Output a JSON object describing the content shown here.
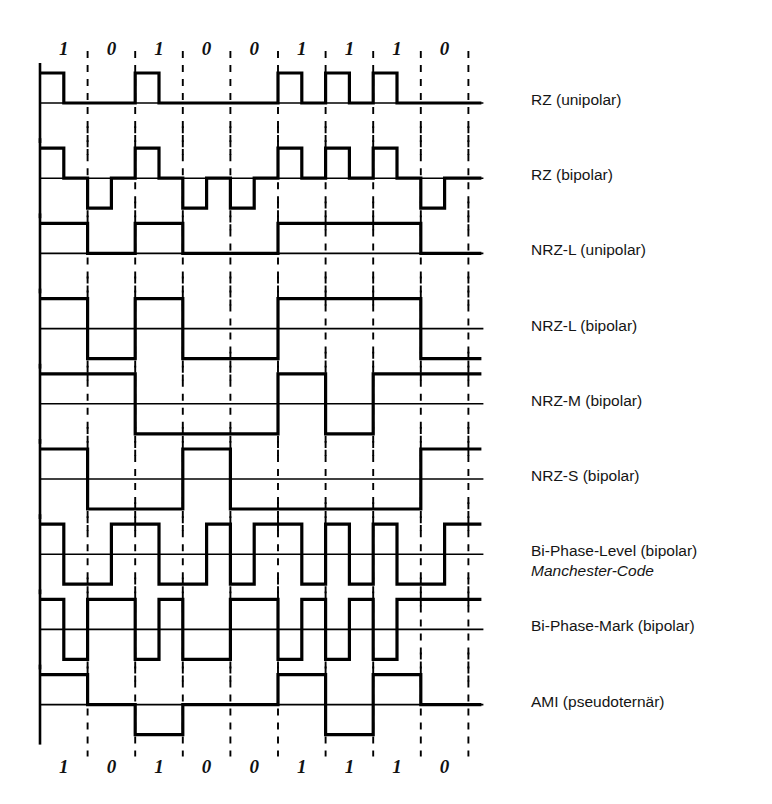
{
  "figure": {
    "bits": [
      "1",
      "0",
      "1",
      "0",
      "0",
      "1",
      "1",
      "1",
      "0"
    ],
    "bit_values": [
      1,
      0,
      1,
      0,
      0,
      1,
      1,
      1,
      0
    ],
    "bit_count": 9,
    "ink_color": "#000000",
    "background_color": "#ffffff"
  },
  "geometry": {
    "origin_x": 40,
    "bit_width": 47.6,
    "first_row_baseline_y": 103,
    "row_spacing": 75.2,
    "amplitude": 30,
    "label_x": 531
  },
  "rows": [
    {
      "id": "rz-unipolar",
      "label": "RZ (unipolar)",
      "sublabel": "",
      "code": "RZ",
      "polarity": "unipolar",
      "levels_per_bit": [
        [
          1,
          0
        ],
        [
          0,
          0
        ],
        [
          1,
          0
        ],
        [
          0,
          0
        ],
        [
          0,
          0
        ],
        [
          1,
          0
        ],
        [
          1,
          0
        ],
        [
          1,
          0
        ],
        [
          0,
          0
        ]
      ]
    },
    {
      "id": "rz-bipolar",
      "label": "RZ (bipolar)",
      "sublabel": "",
      "code": "RZ",
      "polarity": "bipolar",
      "levels_per_bit": [
        [
          1,
          0
        ],
        [
          -1,
          0
        ],
        [
          1,
          0
        ],
        [
          -1,
          0
        ],
        [
          -1,
          0
        ],
        [
          1,
          0
        ],
        [
          1,
          0
        ],
        [
          1,
          0
        ],
        [
          -1,
          0
        ]
      ]
    },
    {
      "id": "nrz-l-unipolar",
      "label": "NRZ-L (unipolar)",
      "sublabel": "",
      "code": "NRZ-L",
      "polarity": "unipolar",
      "levels_per_bit": [
        [
          1,
          1
        ],
        [
          0,
          0
        ],
        [
          1,
          1
        ],
        [
          0,
          0
        ],
        [
          0,
          0
        ],
        [
          1,
          1
        ],
        [
          1,
          1
        ],
        [
          1,
          1
        ],
        [
          0,
          0
        ]
      ]
    },
    {
      "id": "nrz-l-bipolar",
      "label": "NRZ-L (bipolar)",
      "sublabel": "",
      "code": "NRZ-L",
      "polarity": "bipolar",
      "levels_per_bit": [
        [
          1,
          1
        ],
        [
          -1,
          -1
        ],
        [
          1,
          1
        ],
        [
          -1,
          -1
        ],
        [
          -1,
          -1
        ],
        [
          1,
          1
        ],
        [
          1,
          1
        ],
        [
          1,
          1
        ],
        [
          -1,
          -1
        ]
      ]
    },
    {
      "id": "nrz-m-bipolar",
      "label": "NRZ-M (bipolar)",
      "sublabel": "",
      "code": "NRZ-M",
      "polarity": "bipolar",
      "levels_per_bit": [
        [
          1,
          1
        ],
        [
          1,
          1
        ],
        [
          -1,
          -1
        ],
        [
          -1,
          -1
        ],
        [
          -1,
          -1
        ],
        [
          1,
          1
        ],
        [
          -1,
          -1
        ],
        [
          1,
          1
        ],
        [
          1,
          1
        ]
      ]
    },
    {
      "id": "nrz-s-bipolar",
      "label": "NRZ-S (bipolar)",
      "sublabel": "",
      "code": "NRZ-S",
      "polarity": "bipolar",
      "levels_per_bit": [
        [
          1,
          1
        ],
        [
          -1,
          -1
        ],
        [
          -1,
          -1
        ],
        [
          1,
          1
        ],
        [
          -1,
          -1
        ],
        [
          -1,
          -1
        ],
        [
          -1,
          -1
        ],
        [
          -1,
          -1
        ],
        [
          1,
          1
        ]
      ]
    },
    {
      "id": "bi-phase-level",
      "label": "Bi-Phase-Level (bipolar)",
      "sublabel": "Manchester-Code",
      "code": "Bi-Phase-L",
      "polarity": "bipolar",
      "levels_per_bit": [
        [
          1,
          -1
        ],
        [
          -1,
          1
        ],
        [
          1,
          -1
        ],
        [
          -1,
          1
        ],
        [
          -1,
          1
        ],
        [
          1,
          -1
        ],
        [
          1,
          -1
        ],
        [
          1,
          -1
        ],
        [
          -1,
          1
        ]
      ]
    },
    {
      "id": "bi-phase-mark",
      "label": "Bi-Phase-Mark (bipolar)",
      "sublabel": "",
      "code": "Bi-Phase-M",
      "polarity": "bipolar",
      "levels_per_bit": [
        [
          1,
          -1
        ],
        [
          1,
          1
        ],
        [
          -1,
          1
        ],
        [
          -1,
          -1
        ],
        [
          1,
          1
        ],
        [
          -1,
          1
        ],
        [
          -1,
          1
        ],
        [
          -1,
          1
        ],
        [
          1,
          1
        ]
      ]
    },
    {
      "id": "ami",
      "label": "AMI (pseudoternär)",
      "sublabel": "",
      "code": "AMI",
      "polarity": "pseudoternary",
      "levels_per_bit": [
        [
          1,
          1
        ],
        [
          0,
          0
        ],
        [
          -1,
          -1
        ],
        [
          0,
          0
        ],
        [
          0,
          0
        ],
        [
          1,
          1
        ],
        [
          -1,
          -1
        ],
        [
          1,
          1
        ],
        [
          0,
          0
        ]
      ]
    }
  ]
}
